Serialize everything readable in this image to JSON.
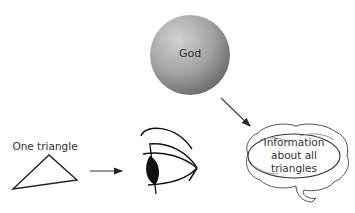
{
  "diagram": {
    "god_label": "God",
    "triangle_label": "One triangle",
    "brain_label_lines": [
      "Information",
      "about all",
      "triangles"
    ],
    "nodes": [
      {
        "id": "god",
        "shape": "sphere",
        "label": "God"
      },
      {
        "id": "triangle",
        "shape": "triangle",
        "label": "One triangle"
      },
      {
        "id": "eye",
        "shape": "eye-icon",
        "label": ""
      },
      {
        "id": "brain",
        "shape": "brain-icon",
        "label": "Information about all triangles"
      }
    ],
    "edges": [
      {
        "from": "triangle",
        "to": "eye"
      },
      {
        "from": "god",
        "to": "brain"
      }
    ],
    "colors": {
      "sphere_light": "#c8c8c8",
      "sphere_dark": "#6e6e6e",
      "stroke": "#222222"
    }
  }
}
